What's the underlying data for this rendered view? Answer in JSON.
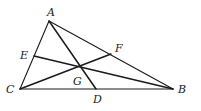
{
  "diagram": {
    "type": "triangle-with-cevians",
    "points": {
      "A": {
        "x": 49,
        "y": 21
      },
      "B": {
        "x": 173,
        "y": 89
      },
      "C": {
        "x": 20,
        "y": 89
      },
      "D": {
        "x": 96,
        "y": 89
      },
      "E": {
        "x": 34,
        "y": 56
      },
      "F": {
        "x": 111,
        "y": 54
      },
      "G": {
        "x": 80,
        "y": 67
      }
    },
    "labels": {
      "A": "A",
      "B": "B",
      "C": "C",
      "D": "D",
      "E": "E",
      "F": "F",
      "G": "G"
    },
    "segments": [
      "AB",
      "BC",
      "CA",
      "AD",
      "BE",
      "CF"
    ]
  }
}
